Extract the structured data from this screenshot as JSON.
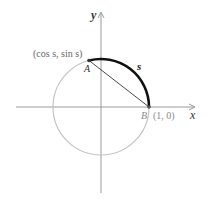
{
  "diagram": {
    "type": "unit-circle",
    "axes": {
      "x_label": "x",
      "y_label": "y"
    },
    "points": {
      "A": {
        "name": "A",
        "coords_label": "(cos s, sin s)"
      },
      "B": {
        "name": "B",
        "coords_label": "(1, 0)"
      }
    },
    "arc_label": "s",
    "colors": {
      "axis": "#9a9a9a",
      "circle": "#bdbdbd",
      "arc": "#111111",
      "chord": "#333333",
      "label": "#333333",
      "muted_label": "#8a8a8a"
    }
  }
}
